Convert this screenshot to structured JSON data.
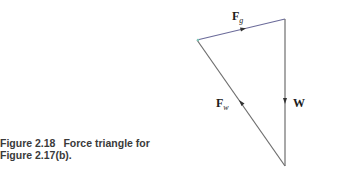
{
  "figure": {
    "number": "Figure 2.18",
    "caption_line1": "Force triangle for",
    "caption_line2": "Figure 2.17(b)."
  },
  "diagram": {
    "type": "force-triangle",
    "vertices": {
      "left": [
        197,
        40
      ],
      "top_right": [
        285,
        19
      ],
      "bottom": [
        285,
        166
      ]
    },
    "vectors": [
      {
        "name": "Fg",
        "label_main": "F",
        "label_sub": "g",
        "from": "left",
        "to": "top_right",
        "color": "#6b6b9a"
      },
      {
        "name": "W",
        "label_main": "W",
        "label_sub": "",
        "from": "top_right",
        "to": "bottom",
        "color": "#6e6e6e"
      },
      {
        "name": "Fw",
        "label_main": "F",
        "label_sub": "w",
        "from": "bottom",
        "to": "left",
        "color": "#6e6e6e"
      }
    ]
  }
}
